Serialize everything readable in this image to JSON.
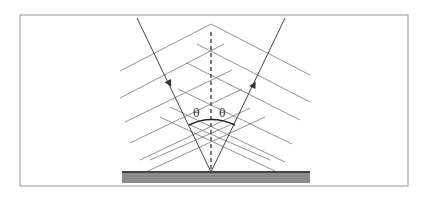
{
  "diagram": {
    "labels": {
      "angle_incident": "θ",
      "angle_reflected": "θ"
    },
    "elements": {
      "incident_ray": "incident ray",
      "reflected_ray": "reflected ray",
      "normal": "surface normal (dashed)",
      "surface": "reflecting surface",
      "wavefronts": "wavefront lines"
    },
    "colors": {
      "line": "#555555",
      "frame": "#999999",
      "surface_top": "#444444",
      "surface_fill": "#8a8a8a"
    }
  }
}
